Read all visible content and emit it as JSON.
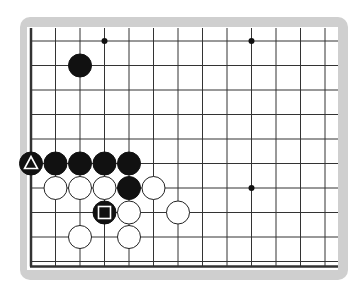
{
  "board": {
    "title": "Go board diagram",
    "grid": {
      "columns": 13,
      "rows": 10,
      "spacing": 24.5,
      "origin_x": 31,
      "origin_y": 41,
      "left_edge": true,
      "bottom_edge": true
    },
    "colors": {
      "frame": "#cfcfcf",
      "board_bg": "#ffffff",
      "line": "#333333",
      "black_stone": "#111111",
      "white_stone": "#ffffff"
    },
    "star_points": [
      {
        "col": 3,
        "row": 0
      },
      {
        "col": 9,
        "row": 0
      },
      {
        "col": 9,
        "row": 6
      }
    ],
    "stones": [
      {
        "color": "black",
        "col": 2,
        "row": 1,
        "mark": ""
      },
      {
        "color": "black",
        "col": 0,
        "row": 5,
        "mark": "triangle"
      },
      {
        "color": "black",
        "col": 1,
        "row": 5,
        "mark": ""
      },
      {
        "color": "black",
        "col": 2,
        "row": 5,
        "mark": ""
      },
      {
        "color": "black",
        "col": 3,
        "row": 5,
        "mark": ""
      },
      {
        "color": "black",
        "col": 4,
        "row": 5,
        "mark": ""
      },
      {
        "color": "white",
        "col": 1,
        "row": 6,
        "mark": ""
      },
      {
        "color": "white",
        "col": 2,
        "row": 6,
        "mark": ""
      },
      {
        "color": "white",
        "col": 3,
        "row": 6,
        "mark": ""
      },
      {
        "color": "black",
        "col": 4,
        "row": 6,
        "mark": ""
      },
      {
        "color": "white",
        "col": 5,
        "row": 6,
        "mark": ""
      },
      {
        "color": "black",
        "col": 3,
        "row": 7,
        "mark": "square"
      },
      {
        "color": "white",
        "col": 4,
        "row": 7,
        "mark": ""
      },
      {
        "color": "white",
        "col": 6,
        "row": 7,
        "mark": ""
      },
      {
        "color": "white",
        "col": 2,
        "row": 8,
        "mark": ""
      },
      {
        "color": "white",
        "col": 4,
        "row": 8,
        "mark": ""
      }
    ]
  }
}
